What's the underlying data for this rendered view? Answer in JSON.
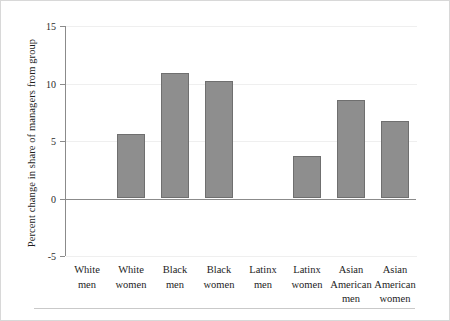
{
  "chart_data": {
    "type": "bar",
    "title": "",
    "xlabel": "",
    "ylabel": "Percent change in share of managers from group",
    "ylim": [
      -5,
      15
    ],
    "yticks": [
      15,
      10,
      5,
      0,
      -5
    ],
    "ytick_labels": [
      "15",
      "10",
      "5",
      "0",
      "-5"
    ],
    "grid": true,
    "legend": null,
    "categories": [
      "White men",
      "White women",
      "Black men",
      "Black women",
      "Latinx men",
      "Latinx women",
      "Asian American men",
      "Asian American women"
    ],
    "category_lines": [
      [
        "White",
        "men"
      ],
      [
        "White",
        "women"
      ],
      [
        "Black",
        "men"
      ],
      [
        "Black",
        "women"
      ],
      [
        "Latinx",
        "men"
      ],
      [
        "Latinx",
        "women"
      ],
      [
        "Asian",
        "American",
        "men"
      ],
      [
        "Asian",
        "American",
        "women"
      ]
    ],
    "values": [
      0,
      5.6,
      10.9,
      10.2,
      0,
      3.7,
      8.6,
      6.7
    ],
    "bar_color": "#8e8e8e",
    "bar_edge_color": "#6f6f6f",
    "axis_color": "#8b8b8b",
    "grid_color": "#efefef"
  }
}
